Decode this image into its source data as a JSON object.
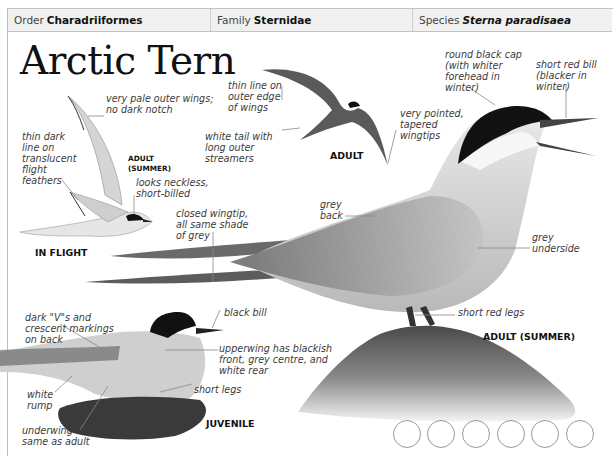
{
  "header": {
    "order_label": "Order",
    "order_value": "Charadriiformes",
    "family_label": "Family",
    "family_value": "Sternidae",
    "species_label": "Species",
    "species_value": "Sterna paradisaea"
  },
  "title": "Arctic Tern",
  "captions": {
    "in_flight": "IN FLIGHT",
    "adult_summer_small": "ADULT\n(SUMMER)",
    "adult": "ADULT",
    "adult_summer": "ADULT (SUMMER)",
    "juvenile": "JUVENILE"
  },
  "annotations": {
    "pale_outer_wings": "very pale outer wings;\nno dark notch",
    "thin_dark_line": "thin dark\nline on\ntranslucent\nflight\nfeathers",
    "looks_neckless": "looks neckless,\nshort-billed",
    "thin_line_outer_edge": "thin line on\nouter edge\nof wings",
    "white_tail": "white tail with\nlong outer\nstreamers",
    "very_pointed": "very pointed,\ntapered\nwingtips",
    "round_black_cap": "round black cap\n(with whiter\nforehead in\nwinter)",
    "short_red_bill": "short red bill\n(blacker in\nwinter)",
    "closed_wingtip": "closed wingtip,\nall same shade\nof grey",
    "grey_back": "grey\nback",
    "grey_underside": "grey\nunderside",
    "short_red_legs": "short red legs",
    "dark_vs": "dark \"V\"s and\ncrescent markings\non back",
    "black_bill": "black bill",
    "upperwing": "upperwing has blackish\nfront, grey centre, and\nwhite rear",
    "white_rump": "white\nrump",
    "short_legs": "short legs",
    "underwing": "underwing\nsame as adult"
  },
  "icons": [
    "habitat-circle-icon",
    "habitat-circle-icon",
    "habitat-circle-icon",
    "habitat-circle-icon",
    "habitat-circle-icon",
    "habitat-circle-icon"
  ]
}
